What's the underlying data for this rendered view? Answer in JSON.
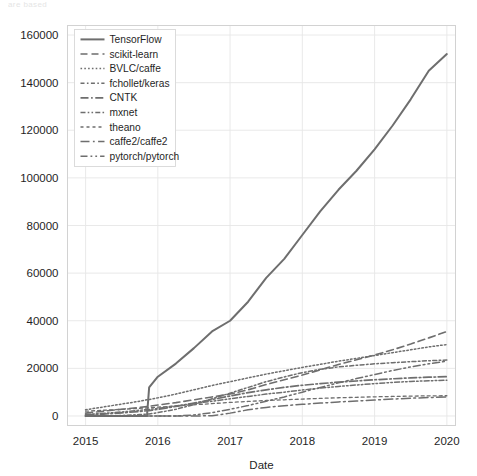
{
  "figure": {
    "top_cutoff_text": "are based",
    "background": "#ffffff"
  },
  "chart_data": {
    "type": "line",
    "title": "",
    "xlabel": "Date",
    "ylabel": "",
    "xlim": [
      2014.75,
      2020.12
    ],
    "ylim": [
      -4000,
      164000
    ],
    "xticks": [
      "2015",
      "2016",
      "2017",
      "2018",
      "2019",
      "2020"
    ],
    "xtick_values": [
      2015,
      2016,
      2017,
      2018,
      2019,
      2020
    ],
    "yticks": [
      "0",
      "20000",
      "40000",
      "60000",
      "80000",
      "100000",
      "120000",
      "140000",
      "160000"
    ],
    "ytick_values": [
      0,
      20000,
      40000,
      60000,
      80000,
      100000,
      120000,
      140000,
      160000
    ],
    "grid": true,
    "grid_color": "#e6e6e6",
    "legend_position": "upper left",
    "line_color": "#6e6e6e",
    "x": [
      2015.0,
      2015.25,
      2015.5,
      2015.75,
      2015.85,
      2015.88,
      2016.0,
      2016.25,
      2016.5,
      2016.75,
      2017.0,
      2017.25,
      2017.5,
      2017.75,
      2018.0,
      2018.25,
      2018.5,
      2018.75,
      2019.0,
      2019.25,
      2019.5,
      2019.75,
      2020.0
    ],
    "series": [
      {
        "name": "TensorFlow",
        "dash": "solid",
        "values": [
          0,
          0,
          0,
          0,
          100,
          12000,
          16500,
          22000,
          28500,
          35500,
          40000,
          48000,
          58000,
          66000,
          76000,
          86000,
          95000,
          103000,
          112000,
          122000,
          133000,
          145000,
          152000
        ]
      },
      {
        "name": "scikit-learn",
        "dash": "dashed",
        "values": [
          1200,
          2000,
          2800,
          3600,
          4000,
          4100,
          4600,
          5600,
          6800,
          8000,
          9200,
          11000,
          13200,
          15200,
          17200,
          19400,
          21600,
          23600,
          25600,
          27800,
          30200,
          32800,
          35500
        ]
      },
      {
        "name": "BVLC/caffe",
        "dash": "dotted",
        "values": [
          2600,
          3800,
          5000,
          6200,
          6800,
          6900,
          7600,
          9200,
          11000,
          12800,
          14400,
          16000,
          17600,
          19000,
          20400,
          21700,
          23000,
          24200,
          25400,
          26600,
          27800,
          29000,
          30000
        ]
      },
      {
        "name": "fchollet/keras",
        "dash": "dashdot-short",
        "values": [
          0,
          0,
          200,
          600,
          800,
          850,
          1400,
          2800,
          4800,
          7200,
          9600,
          12000,
          14400,
          16400,
          18200,
          19600,
          20600,
          21300,
          21900,
          22400,
          22800,
          23200,
          23500
        ]
      },
      {
        "name": "CNTK",
        "dash": "dashdot",
        "values": [
          400,
          800,
          1300,
          1900,
          2200,
          2250,
          2800,
          4000,
          5400,
          6900,
          8400,
          9800,
          11000,
          12000,
          12900,
          13600,
          14200,
          14700,
          15200,
          15600,
          16000,
          16300,
          16500
        ]
      },
      {
        "name": "mxnet",
        "dash": "dashdotdot",
        "values": [
          600,
          1100,
          1700,
          2400,
          2700,
          2750,
          3200,
          4200,
          5200,
          6200,
          7200,
          8200,
          9200,
          10000,
          10900,
          11700,
          12400,
          13000,
          13600,
          14100,
          14500,
          14800,
          15000
        ]
      },
      {
        "name": "theano",
        "dash": "dashed-fine",
        "values": [
          2000,
          2400,
          2800,
          3200,
          3400,
          3420,
          3700,
          4200,
          4700,
          5200,
          5700,
          6100,
          6500,
          6800,
          7100,
          7400,
          7650,
          7850,
          8050,
          8200,
          8350,
          8450,
          8500
        ]
      },
      {
        "name": "caffe2/caffe2",
        "dash": "dashdot-long",
        "values": [
          0,
          0,
          0,
          0,
          0,
          0,
          0,
          0,
          0,
          100,
          1200,
          2600,
          3600,
          4300,
          4900,
          5400,
          5900,
          6300,
          6700,
          7100,
          7450,
          7750,
          8000
        ]
      },
      {
        "name": "pytorch/pytorch",
        "dash": "dashdotdot-long",
        "values": [
          0,
          0,
          0,
          0,
          0,
          0,
          0,
          0,
          400,
          1400,
          2800,
          4400,
          6200,
          8000,
          10000,
          12000,
          13900,
          15700,
          17400,
          19100,
          20600,
          21900,
          23000
        ]
      }
    ]
  }
}
